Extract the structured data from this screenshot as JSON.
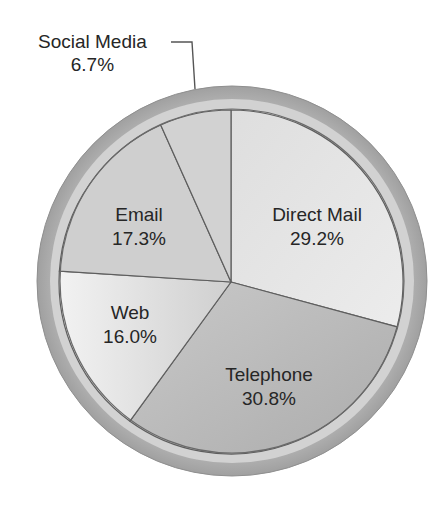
{
  "chart_data": {
    "type": "pie",
    "title": "",
    "start_angle_deg": 0,
    "direction": "clockwise",
    "slices": [
      {
        "label": "Direct Mail",
        "value": 29.2,
        "value_text": "29.2%",
        "color": "#e4e4e4"
      },
      {
        "label": "Telephone",
        "value": 30.8,
        "value_text": "30.8%",
        "color": "#b9b9b9"
      },
      {
        "label": "Web",
        "value": 16.0,
        "value_text": "16.0%",
        "color": "#d6d6d6"
      },
      {
        "label": "Email",
        "value": 17.3,
        "value_text": "17.3%",
        "color": "#cfcfcf"
      },
      {
        "label": "Social Media",
        "value": 6.7,
        "value_text": "6.7%",
        "color": "#d2d2d2"
      }
    ],
    "legend": null
  },
  "labels": {
    "direct_mail": {
      "name": "Direct Mail",
      "pct": "29.2%"
    },
    "telephone": {
      "name": "Telephone",
      "pct": "30.8%"
    },
    "web": {
      "name": "Web",
      "pct": "16.0%"
    },
    "email": {
      "name": "Email",
      "pct": "17.3%"
    },
    "social_media": {
      "name": "Social Media",
      "pct": "6.7%"
    }
  },
  "style": {
    "ring_color": "#a8a8a8",
    "ring_inner_color": "#d4d4d4",
    "divider_color": "#5e5e5e"
  }
}
